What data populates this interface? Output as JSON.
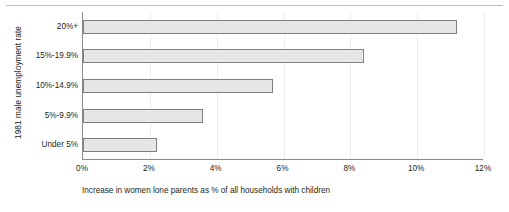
{
  "chart_data": {
    "type": "bar",
    "orientation": "horizontal",
    "title": "",
    "xlabel": "Increase in women lone parents as % of all households with children",
    "ylabel": "1981 male unemployment rate",
    "categories": [
      "20%+",
      "15%-19.9%",
      "10%-14.9%",
      "5%-9.9%",
      "Under 5%"
    ],
    "values": [
      11.2,
      8.4,
      5.7,
      3.6,
      2.2
    ],
    "xlim": [
      0,
      12
    ],
    "xticks": [
      0,
      2,
      4,
      6,
      8,
      10,
      12
    ],
    "xtick_labels": [
      "0%",
      "2%",
      "4%",
      "6%",
      "8%",
      "10%",
      "12%"
    ],
    "grid": "vertical",
    "legend": "none",
    "bar_fill_color": "#e6e6e6",
    "bar_border_color": "#7f7f7f",
    "axis_color": "#8b8b8b",
    "gridline_color": "#ededed",
    "text_color": "#231f20"
  }
}
